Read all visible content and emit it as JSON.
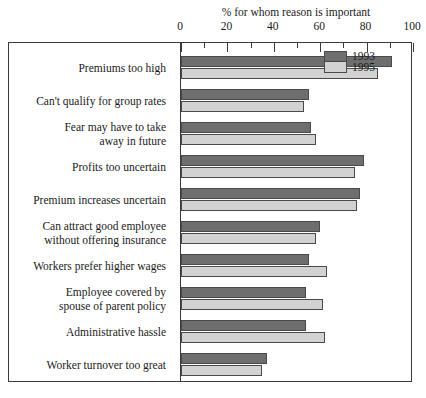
{
  "chart_data": {
    "type": "bar",
    "orientation": "horizontal",
    "title": "% for whom reason is important",
    "xlabel": "% for whom reason is important",
    "ylabel": "",
    "xlim": [
      0,
      100
    ],
    "xticks": [
      0,
      20,
      40,
      60,
      80,
      100
    ],
    "xticks_minor": [
      10,
      30,
      50,
      70,
      90
    ],
    "grid": false,
    "legend_position": "upper right inside plot",
    "categories": [
      "Premiums too high",
      "Can't qualify for group rates",
      "Fear may have to take away in future",
      "Profits too uncertain",
      "Premium increases uncertain",
      "Can attract good employee without offering insurance",
      "Workers prefer higher wages",
      "Employee covered by spouse of parent policy",
      "Administrative hassle",
      "Worker turnover too great"
    ],
    "category_lines": [
      [
        "Premiums too high"
      ],
      [
        "Can't qualify for group rates"
      ],
      [
        "Fear may have to take",
        "away in future"
      ],
      [
        "Profits too uncertain"
      ],
      [
        "Premium increases uncertain"
      ],
      [
        "Can attract good employee",
        "without offering insurance"
      ],
      [
        "Workers prefer higher wages"
      ],
      [
        "Employee covered by",
        "spouse of parent policy"
      ],
      [
        "Administrative hassle"
      ],
      [
        "Worker turnover too great"
      ]
    ],
    "series": [
      {
        "name": "1993",
        "color": "#6e6e6e",
        "values": [
          91,
          55,
          56,
          79,
          77,
          60,
          55,
          54,
          54,
          37
        ]
      },
      {
        "name": "1995",
        "color": "#d2d2d2",
        "values": [
          85,
          53,
          58,
          75,
          76,
          58,
          63,
          61,
          62,
          35
        ]
      }
    ]
  },
  "legend": {
    "entries": [
      {
        "label": "1993"
      },
      {
        "label": "1995"
      }
    ]
  }
}
